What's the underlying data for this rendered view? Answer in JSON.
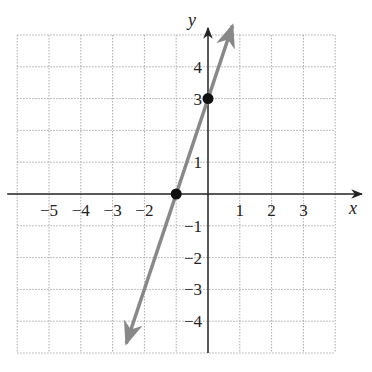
{
  "chart_data": {
    "type": "line",
    "title": "",
    "xlabel": "x",
    "ylabel": "y",
    "xlim": [
      -6,
      4
    ],
    "ylim": [
      -5,
      5
    ],
    "grid": true,
    "x_tick_labels": [
      "-5",
      "-4",
      "-3",
      "-2",
      "1",
      "2",
      "3"
    ],
    "y_tick_labels": [
      "4",
      "3",
      "1",
      "-1",
      "-2",
      "-3",
      "-4"
    ],
    "series": [
      {
        "name": "y = 3x + 3",
        "slope": 3,
        "intercept": 3,
        "x": [
          -2.57,
          0.77
        ],
        "y": [
          -4.7,
          5.3
        ],
        "color": "#888888"
      }
    ],
    "points": [
      {
        "x": -1,
        "y": 0,
        "label": "x-intercept"
      },
      {
        "x": 0,
        "y": 3,
        "label": "y-intercept"
      }
    ]
  },
  "labels": {
    "x_axis": "x",
    "y_axis": "y",
    "xticks": [
      {
        "v": -5,
        "t": "−5"
      },
      {
        "v": -4,
        "t": "−4"
      },
      {
        "v": -3,
        "t": "−3"
      },
      {
        "v": -2,
        "t": "−2"
      },
      {
        "v": 1,
        "t": "1"
      },
      {
        "v": 2,
        "t": "2"
      },
      {
        "v": 3,
        "t": "3"
      }
    ],
    "yticks": [
      {
        "v": 4,
        "t": "4"
      },
      {
        "v": 3,
        "t": "3"
      },
      {
        "v": 1,
        "t": "1"
      },
      {
        "v": -1,
        "t": "−1"
      },
      {
        "v": -2,
        "t": "−2"
      },
      {
        "v": -3,
        "t": "−3"
      },
      {
        "v": -4,
        "t": "−4"
      }
    ]
  }
}
